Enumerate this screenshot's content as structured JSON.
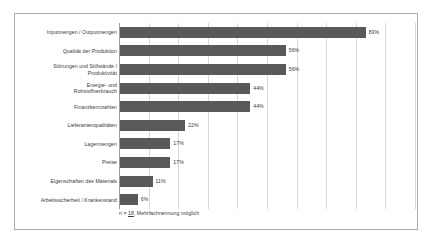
{
  "chart_data": {
    "type": "bar",
    "orientation": "horizontal",
    "title": "",
    "subtitle": "",
    "xlabel": "",
    "ylabel": "",
    "xlim": [
      0,
      100
    ],
    "grid": true,
    "gridlines_x": [
      0,
      10,
      20,
      30,
      40,
      50,
      60,
      70,
      80,
      90,
      100
    ],
    "legend": "none",
    "bar_color": "#595959",
    "categories": [
      "Inputmengen / Outputmengen",
      "Qualität der Produktion",
      "Störungen und Stillstände /\nProduktivität",
      "Energie- und\nRohstoffverbrauch",
      "Finanzkennzahlen",
      "Lieferantenqualitäten",
      "Lagermengen",
      "Preise",
      "Eigenschaften des Materials",
      "Arbeitssicherheit / Krankenstand"
    ],
    "values": [
      83,
      56,
      56,
      44,
      44,
      22,
      17,
      17,
      11,
      6
    ],
    "value_labels": [
      "83%",
      "56%",
      "56%",
      "44%",
      "44%",
      "22%",
      "17%",
      "17%",
      "11%",
      "6%"
    ],
    "annotation": {
      "prefix": "n = ",
      "n_value": "18",
      "suffix": ", Mehrfachnennung möglich",
      "full_text": "n = 18, Mehrfachnennung möglich"
    }
  },
  "frame": {
    "border_color": "#a9a9a9",
    "background": "#ffffff"
  }
}
